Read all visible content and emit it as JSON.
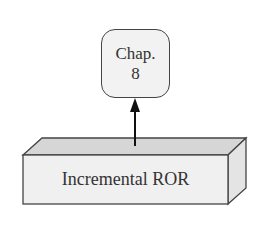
{
  "diagram": {
    "top_node": {
      "line1": "Chap.",
      "line2": "8"
    },
    "bottom_block": {
      "label": "Incremental ROR"
    },
    "arrow": {
      "from": "bottom_block",
      "to": "top_node",
      "direction": "up"
    },
    "colors": {
      "stroke": "#444444",
      "front_face": "#f0f0f0",
      "top_face": "#d6d6d6",
      "side_face": "#e4e4e4",
      "node_fill": "#f2f2f2",
      "text": "#333333"
    }
  }
}
